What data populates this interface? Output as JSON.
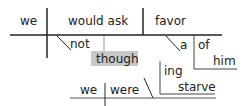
{
  "diagram": {
    "type": "sentence-diagram",
    "main_clause": {
      "subject": "we",
      "verb": "would ask",
      "object": "favor",
      "modifiers": {
        "verb_adverb": "not",
        "object_article": "a",
        "object_preposition": "of",
        "preposition_object": "him"
      }
    },
    "subordinate_clause": {
      "conjunction": "though",
      "subject": "we",
      "verb": "were",
      "complement_ing": "ing",
      "complement_word": "starve"
    },
    "colors": {
      "line": "#222222",
      "connector": "#999999",
      "conjunction_box": "#c8c8c8",
      "text": "#222222"
    }
  }
}
